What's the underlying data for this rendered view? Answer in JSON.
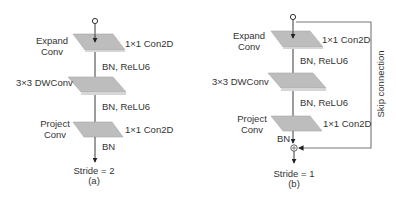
{
  "colors": {
    "plate_fill": "#bdbdbd",
    "plate_edge": "#a8a8a8",
    "line": "#3a3a3a",
    "skip_line": "#777777",
    "text": "#333333",
    "background": "#ffffff"
  },
  "panel_a": {
    "caption": "(a)",
    "stride_label": "Stride = 2",
    "layers": [
      {
        "name_line1": "Expand",
        "name_line2": "Conv",
        "op": "1×1 Con2D",
        "after": "BN, ReLU6"
      },
      {
        "name_line1": "3×3 DWConv",
        "name_line2": "",
        "op": "",
        "after": "BN, ReLU6"
      },
      {
        "name_line1": "Project",
        "name_line2": "Conv",
        "op": "1×1 Con2D",
        "after": "BN"
      }
    ]
  },
  "panel_b": {
    "caption": "(b)",
    "stride_label": "Stride = 1",
    "skip_label": "Skip connection",
    "add_node_icon": "circled-plus-icon",
    "layers": [
      {
        "name_line1": "Expand",
        "name_line2": "Conv",
        "op": "1×1 Con2D",
        "after": "BN, ReLU6"
      },
      {
        "name_line1": "3×3 DWConv",
        "name_line2": "",
        "op": "",
        "after": "BN, ReLU6"
      },
      {
        "name_line1": "Project",
        "name_line2": "Conv",
        "op": "1×1 Con2D",
        "after": "BN"
      }
    ]
  }
}
